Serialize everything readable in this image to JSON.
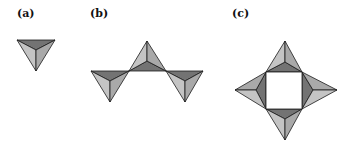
{
  "panels": [
    {
      "id": "a",
      "label": "(a)",
      "description": "single tetrahedron viewed from above"
    },
    {
      "id": "b",
      "label": "(b)",
      "description": "chain of three corner-sharing tetrahedra"
    },
    {
      "id": "c",
      "label": "(c)",
      "description": "ring of four corner-sharing tetrahedra"
    }
  ],
  "colors": {
    "dark_face": "#737373",
    "mid_face": "#a9a9a9",
    "light_face": "#c4c4c4",
    "edge": "#1a1a1a",
    "background": "#ffffff"
  }
}
